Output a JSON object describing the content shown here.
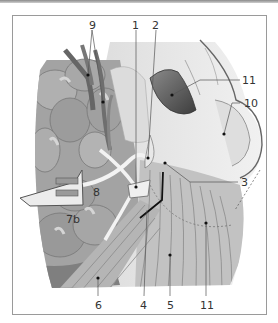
{
  "figure": {
    "type": "anatomical-illustration",
    "labels": [
      {
        "id": "l1",
        "text": "1",
        "x": 132,
        "y": 20
      },
      {
        "id": "l2",
        "text": "2",
        "x": 152,
        "y": 20
      },
      {
        "id": "l3",
        "text": "3",
        "x": 241,
        "y": 177
      },
      {
        "id": "l4",
        "text": "4",
        "x": 140,
        "y": 300
      },
      {
        "id": "l5",
        "text": "5",
        "x": 167,
        "y": 300
      },
      {
        "id": "l6",
        "text": "6",
        "x": 95,
        "y": 300
      },
      {
        "id": "l7a",
        "text": "7a",
        "x": 66,
        "y": 214
      },
      {
        "id": "l7b",
        "text": "7b",
        "x": 93,
        "y": 187
      },
      {
        "id": "l8",
        "text": "8",
        "x": 89,
        "y": 20
      },
      {
        "id": "l9",
        "text": "9",
        "x": 244,
        "y": 98
      },
      {
        "id": "l10",
        "text": "10",
        "x": 242,
        "y": 75
      },
      {
        "id": "l11",
        "text": "11",
        "x": 200,
        "y": 300
      }
    ],
    "colors": {
      "gland_dark": "#8f8f8f",
      "gland_mid": "#a9a9a9",
      "gland_light": "#c4c4c4",
      "muscle": "#b8b8b8",
      "muscle_light": "#d0d0d0",
      "skin": "#e6e6e6",
      "vessel": "#6e6e6e",
      "cavity": "#555555",
      "leader": "#555555",
      "frame": "#9a9a9a"
    }
  }
}
